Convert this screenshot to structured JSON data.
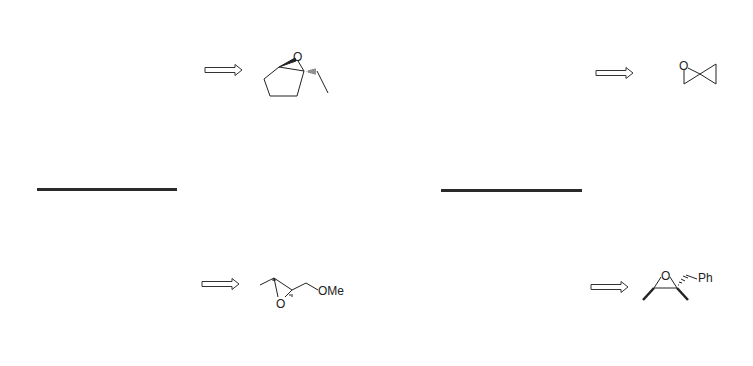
{
  "diagram": {
    "type": "retrosynthesis-worksheet",
    "colors": {
      "ink": "#222222",
      "line": "#2a2a2a",
      "background": "#ffffff"
    },
    "problems": [
      {
        "id": "p1",
        "arrow": "retrosynthetic-arrow",
        "target": "1-ethyl-6-oxabicyclo[3.1.0]hexane",
        "labels": {
          "oxygen": "O"
        }
      },
      {
        "id": "p2",
        "arrow": "retrosynthetic-arrow",
        "target": "1-oxaspiro[2.2]pentane",
        "labels": {
          "oxygen": "O"
        }
      },
      {
        "id": "p3",
        "arrow": "retrosynthetic-arrow",
        "target": "methoxymethyl methyl epoxide",
        "labels": {
          "oxygen": "O",
          "substituent": "OMe"
        }
      },
      {
        "id": "p4",
        "arrow": "retrosynthetic-arrow",
        "target": "benzyl dimethyl epoxide",
        "labels": {
          "oxygen": "O",
          "substituent": "Ph"
        }
      }
    ],
    "answer_lines": [
      {
        "id": "line-left"
      },
      {
        "id": "line-right"
      }
    ]
  }
}
